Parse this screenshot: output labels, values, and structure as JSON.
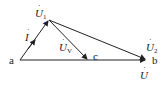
{
  "diagram": {
    "points": {
      "a": {
        "label": "a",
        "x": 20,
        "y": 60
      },
      "top": {
        "x": 49,
        "y": 20
      },
      "c": {
        "label": "c",
        "x": 88,
        "y": 60
      },
      "b": {
        "label": "b",
        "x": 146,
        "y": 60
      }
    },
    "labels": {
      "current": {
        "base": "I",
        "dot": "·"
      },
      "u1": {
        "base": "U",
        "sub": "1",
        "dot": "·"
      },
      "uv": {
        "base": "U",
        "sub": "V",
        "dot": "·"
      },
      "u2": {
        "base": "U",
        "sub": "2",
        "dot": "·"
      },
      "u": {
        "base": "U",
        "dot": "·"
      },
      "a": "a",
      "b": "b",
      "c": "c"
    },
    "colors": {
      "stroke": "#222222",
      "background": "#ffffff"
    }
  }
}
